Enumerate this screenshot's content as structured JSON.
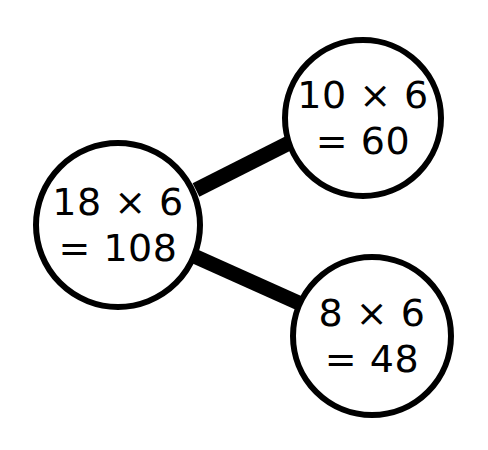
{
  "diagram": {
    "type": "number-bond-branching-diagram",
    "background_color": "#ffffff",
    "stroke_color": "#000000",
    "circle_stroke_width": 6,
    "connector_stroke_width": 15,
    "nodes": [
      {
        "id": "root",
        "role": "whole",
        "cx": 118,
        "cy": 225,
        "r": 82,
        "font_size": 38,
        "line1": "18 × 6",
        "line2": "= 108",
        "line1_dy": -10,
        "line2_dy": 36
      },
      {
        "id": "part-upper",
        "role": "part",
        "cx": 363,
        "cy": 118,
        "r": 78,
        "font_size": 38,
        "line1": "10 × 6",
        "line2": "= 60",
        "line1_dy": -10,
        "line2_dy": 36
      },
      {
        "id": "part-lower",
        "role": "part",
        "cx": 372,
        "cy": 336,
        "r": 79,
        "font_size": 38,
        "line1": "8 × 6",
        "line2": "= 48",
        "line1_dy": -10,
        "line2_dy": 36
      }
    ],
    "connectors": [
      {
        "id": "root-to-upper",
        "from": "root",
        "to": "part-upper",
        "x1": 196,
        "y1": 190,
        "x2": 291,
        "y2": 142
      },
      {
        "id": "root-to-lower",
        "from": "root",
        "to": "part-lower",
        "x1": 194,
        "y1": 256,
        "x2": 301,
        "y2": 304
      }
    ]
  }
}
